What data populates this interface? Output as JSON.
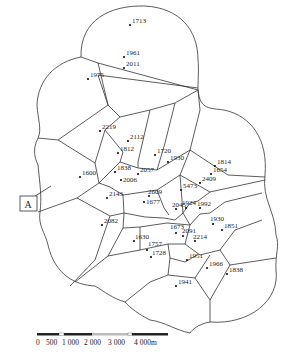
{
  "figure": {
    "type": "voronoi-thiessen-polygon-map",
    "marker": {
      "label": "A"
    },
    "scale_bar": {
      "labels": [
        "0",
        "500",
        "1 000",
        "2 000",
        "3 000",
        "4 000m"
      ],
      "unit": "m"
    },
    "sites": [
      {
        "label": "1713",
        "x": 130,
        "y": 25
      },
      {
        "label": "1961",
        "x": 124,
        "y": 57
      },
      {
        "label": "2011",
        "x": 124,
        "y": 68
      },
      {
        "label": "1975",
        "x": 88,
        "y": 79
      },
      {
        "label": "2219",
        "x": 100,
        "y": 131
      },
      {
        "label": "2112",
        "x": 128,
        "y": 141
      },
      {
        "label": "1812",
        "x": 118,
        "y": 153
      },
      {
        "label": "1720",
        "x": 155,
        "y": 155
      },
      {
        "label": "1930",
        "x": 168,
        "y": 162
      },
      {
        "label": "1600",
        "x": 80,
        "y": 177
      },
      {
        "label": "1838",
        "x": 115,
        "y": 172
      },
      {
        "label": "2057",
        "x": 138,
        "y": 174
      },
      {
        "label": "2006",
        "x": 121,
        "y": 180
      },
      {
        "label": "1814",
        "x": 215,
        "y": 166
      },
      {
        "label": "1654",
        "x": 211,
        "y": 174
      },
      {
        "label": "2409",
        "x": 200,
        "y": 183
      },
      {
        "label": "5473",
        "x": 181,
        "y": 190
      },
      {
        "label": "2143",
        "x": 107,
        "y": 198
      },
      {
        "label": "2609",
        "x": 149,
        "y": 196
      },
      {
        "label": "1677",
        "x": 144,
        "y": 202
      },
      {
        "label": "2045",
        "x": 176,
        "y": 209
      },
      {
        "label": "1924",
        "x": 186,
        "y": 208
      },
      {
        "label": "1992",
        "x": 200,
        "y": 208
      },
      {
        "label": "2082",
        "x": 102,
        "y": 225
      },
      {
        "label": "1930",
        "x": 213,
        "y": 224
      },
      {
        "label": "1851",
        "x": 222,
        "y": 230
      },
      {
        "label": "1673",
        "x": 176,
        "y": 233
      },
      {
        "label": "2091",
        "x": 183,
        "y": 236
      },
      {
        "label": "2214",
        "x": 195,
        "y": 241
      },
      {
        "label": "1630",
        "x": 134,
        "y": 241
      },
      {
        "label": "1757",
        "x": 147,
        "y": 250
      },
      {
        "label": "1728",
        "x": 151,
        "y": 257
      },
      {
        "label": "1951",
        "x": 187,
        "y": 260
      },
      {
        "label": "1966",
        "x": 207,
        "y": 268
      },
      {
        "label": "1838",
        "x": 227,
        "y": 274
      },
      {
        "label": "1941",
        "x": 176,
        "y": 286
      }
    ]
  }
}
